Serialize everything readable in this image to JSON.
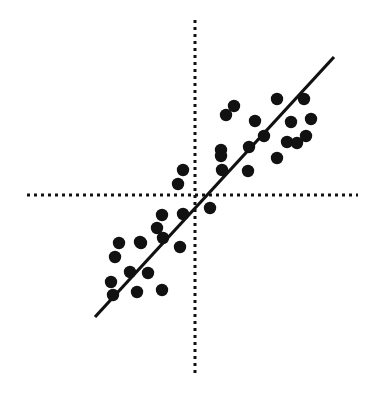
{
  "figure": {
    "background_color": "#ffffff",
    "ink_color": "#111111",
    "width": 379,
    "height": 396
  },
  "chart_data": {
    "type": "scatter",
    "title": "",
    "subtitle": "",
    "xlabel": "",
    "ylabel": "",
    "xlim": [
      -194,
      185
    ],
    "ylim": [
      -201,
      195
    ],
    "grid": false,
    "legend": false,
    "legend_position": "none",
    "tick_labels": {
      "x": [],
      "y": []
    },
    "annotations": [],
    "axes": {
      "style": "dashed-crosshair",
      "origin_px": {
        "x": 195,
        "y": 195
      },
      "x_axis_px": {
        "x1": 27,
        "y1": 195,
        "x2": 358,
        "y2": 195
      },
      "y_axis_px": {
        "x1": 195,
        "y1": 20,
        "x2": 195,
        "y2": 375
      },
      "dash_pattern": "3 4",
      "line_width": 3,
      "color": "#111111"
    },
    "trend_line": {
      "name": "fitted regression line",
      "style": "solid",
      "color": "#111111",
      "line_width": 3.2,
      "p1_px": {
        "x": 95,
        "y": 317
      },
      "p2_px": {
        "x": 334,
        "y": 57
      },
      "slope_px": -1.088,
      "passes_through_origin": true
    },
    "marker": {
      "shape": "circle",
      "color": "#111111",
      "radius_px": 6.2
    },
    "points_px": [
      {
        "x": 234,
        "y": 106
      },
      {
        "x": 226,
        "y": 115
      },
      {
        "x": 277,
        "y": 99
      },
      {
        "x": 304,
        "y": 99
      },
      {
        "x": 255,
        "y": 121
      },
      {
        "x": 291,
        "y": 122
      },
      {
        "x": 311,
        "y": 119
      },
      {
        "x": 264,
        "y": 136
      },
      {
        "x": 306,
        "y": 136
      },
      {
        "x": 221,
        "y": 150
      },
      {
        "x": 287,
        "y": 142
      },
      {
        "x": 297,
        "y": 143
      },
      {
        "x": 249,
        "y": 147
      },
      {
        "x": 277,
        "y": 158
      },
      {
        "x": 221,
        "y": 156
      },
      {
        "x": 183,
        "y": 170
      },
      {
        "x": 248,
        "y": 171
      },
      {
        "x": 222,
        "y": 170
      },
      {
        "x": 178,
        "y": 184
      },
      {
        "x": 210,
        "y": 208
      },
      {
        "x": 162,
        "y": 215
      },
      {
        "x": 183,
        "y": 214
      },
      {
        "x": 157,
        "y": 228
      },
      {
        "x": 163,
        "y": 238
      },
      {
        "x": 140,
        "y": 242
      },
      {
        "x": 119,
        "y": 243
      },
      {
        "x": 141,
        "y": 243
      },
      {
        "x": 180,
        "y": 247
      },
      {
        "x": 115,
        "y": 257
      },
      {
        "x": 130,
        "y": 272
      },
      {
        "x": 148,
        "y": 273
      },
      {
        "x": 111,
        "y": 282
      },
      {
        "x": 113,
        "y": 295
      },
      {
        "x": 137,
        "y": 292
      },
      {
        "x": 162,
        "y": 290
      }
    ],
    "point_count": 35,
    "relationship": "positive linear correlation"
  }
}
